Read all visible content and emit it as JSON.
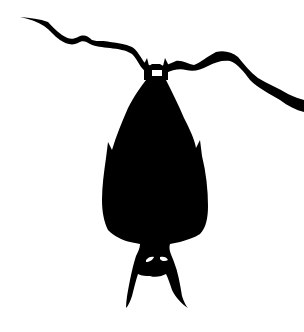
{
  "scene": {
    "subject": "bat silhouette hanging upside down from a branch",
    "background_color": "#ffffff",
    "silhouette_color": "#000000",
    "eye_color": "#ffffff"
  }
}
